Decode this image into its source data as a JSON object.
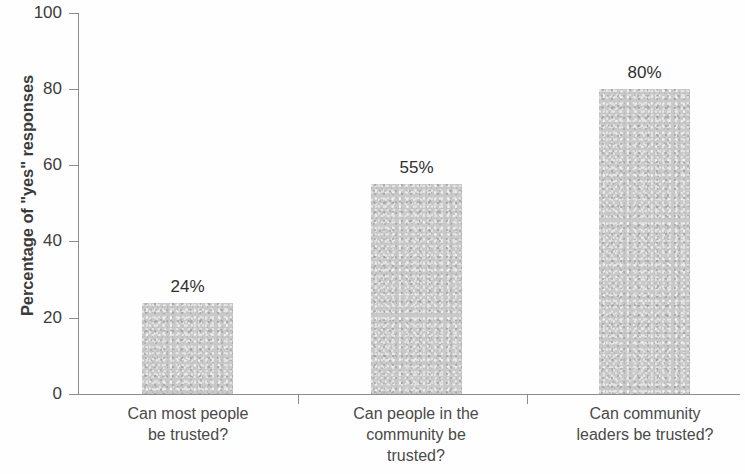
{
  "chart_data": {
    "type": "bar",
    "title": "",
    "subtitle": "",
    "xlabel": "",
    "ylabel": "Percentage of \"yes\" responses",
    "ylim": [
      0,
      100
    ],
    "ytick_labels": [
      "0",
      "20",
      "40",
      "60",
      "80",
      "100"
    ],
    "ytick_values": [
      0,
      20,
      40,
      60,
      80,
      100
    ],
    "grid": false,
    "legend": null,
    "bar_color": "#c9c9c9",
    "axis_color": "#8c8c8c",
    "categories": [
      "Can most people be trusted?",
      "Can people in the community be trusted?",
      "Can community leaders be trusted?"
    ],
    "category_lines": [
      [
        "Can most people",
        "be trusted?"
      ],
      [
        "Can people in the",
        "community be",
        "trusted?"
      ],
      [
        "Can community",
        "leaders be trusted?"
      ]
    ],
    "values": [
      24,
      55,
      80
    ],
    "value_labels": [
      "24%",
      "55%",
      "80%"
    ]
  }
}
